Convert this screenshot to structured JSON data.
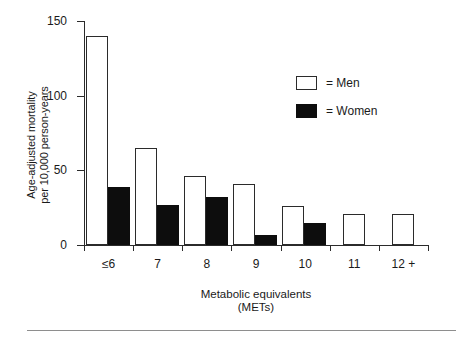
{
  "chart_data": {
    "type": "bar",
    "title": "",
    "xlabel": "Metabolic equivalents\n(METs)",
    "ylabel": "Age-adjusted mortality\nper 10,000 person-years",
    "categories": [
      "≤6",
      "7",
      "8",
      "9",
      "10",
      "11",
      "12 +"
    ],
    "series": [
      {
        "name": "Men",
        "values": [
          140,
          65,
          46,
          41,
          26,
          21,
          21
        ],
        "color": "#ffffff"
      },
      {
        "name": "Women",
        "values": [
          39,
          27,
          32,
          7,
          15,
          null,
          null
        ],
        "color": "#0d0d0d"
      }
    ],
    "ylim": [
      0,
      150
    ],
    "yticks": [
      0,
      50,
      100,
      150
    ],
    "ytick_labels": [
      "0",
      "50",
      "100",
      "150"
    ],
    "grid": false,
    "legend_position": "upper-right",
    "legend_entries": [
      {
        "label": "= Men",
        "swatch": "open-square"
      },
      {
        "label": "= Women",
        "swatch": "filled-square"
      }
    ]
  },
  "axes": {
    "y_title": "Age-adjusted mortality\nper 10,000 person-years",
    "x_title": "Metabolic equivalents\n(METs)"
  }
}
